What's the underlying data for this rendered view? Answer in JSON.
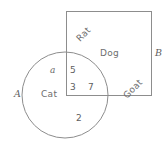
{
  "diagram": {
    "type": "venn-diagram",
    "title": "",
    "sets": [
      {
        "id": "A",
        "label": "A",
        "shape": "circle",
        "member_label": "Cat"
      },
      {
        "id": "B",
        "label": "B",
        "shape": "rectangle",
        "member_labels": [
          "Rat",
          "Dog",
          "Goat"
        ]
      }
    ],
    "set_labels": {
      "circle_label": "A",
      "rect_label": "B"
    },
    "region_labels": {
      "rat": "Rat",
      "dog": "Dog",
      "goat": "Goat",
      "cat": "Cat",
      "element_a": "a"
    },
    "numbers": {
      "intersection_top": "5",
      "intersection_bottom_left": "3",
      "intersection_bottom_right": "7",
      "circle_only_bottom": "2"
    },
    "colors": {
      "stroke": "#8d8d8d",
      "text": "#6b6b6b",
      "background": "#ffffff"
    }
  }
}
